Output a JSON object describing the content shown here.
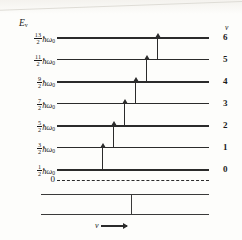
{
  "figure": {
    "type": "energy-level-diagram"
  },
  "axes": {
    "energy_axis_title": "E",
    "energy_axis_subscript": "v",
    "quantum_number_heading": "v",
    "bottom_axis_label": "v",
    "bottom_axis_arrow": "⟶"
  },
  "zero": {
    "label": "0"
  },
  "levels": [
    {
      "v": "6",
      "numerator": "13",
      "denominator": "2",
      "hbar": "ħ",
      "omega": "ω",
      "omega_sub": "0",
      "y": 37
    },
    {
      "v": "5",
      "numerator": "11",
      "denominator": "2",
      "hbar": "ħ",
      "omega": "ω",
      "omega_sub": "0",
      "y": 59
    },
    {
      "v": "4",
      "numerator": "9",
      "denominator": "2",
      "hbar": "ħ",
      "omega": "ω",
      "omega_sub": "0",
      "y": 81
    },
    {
      "v": "3",
      "numerator": "7",
      "denominator": "2",
      "hbar": "ħ",
      "omega": "ω",
      "omega_sub": "0",
      "y": 103
    },
    {
      "v": "2",
      "numerator": "5",
      "denominator": "2",
      "hbar": "ħ",
      "omega": "ω",
      "omega_sub": "0",
      "y": 125
    },
    {
      "v": "1",
      "numerator": "3",
      "denominator": "2",
      "hbar": "ħ",
      "omega": "ω",
      "omega_sub": "0",
      "y": 147
    },
    {
      "v": "0",
      "numerator": "1",
      "denominator": "2",
      "hbar": "ħ",
      "omega": "ω",
      "omega_sub": "0",
      "y": 169
    }
  ],
  "zero_line_y": 180,
  "transitions": [
    {
      "from_v": "0",
      "to_v": "1",
      "x": 102,
      "y_top": 147,
      "y_bottom": 169
    },
    {
      "from_v": "1",
      "to_v": "2",
      "x": 113,
      "y_top": 125,
      "y_bottom": 147
    },
    {
      "from_v": "2",
      "to_v": "3",
      "x": 124,
      "y_top": 103,
      "y_bottom": 125
    },
    {
      "from_v": "3",
      "to_v": "4",
      "x": 135,
      "y_top": 81,
      "y_bottom": 103
    },
    {
      "from_v": "4",
      "to_v": "5",
      "x": 146,
      "y_top": 59,
      "y_bottom": 81
    },
    {
      "from_v": "5",
      "to_v": "6",
      "x": 157,
      "y_top": 37,
      "y_bottom": 59
    }
  ],
  "spectrum": {
    "top_rule_y": 194,
    "bottom_rule_y": 214,
    "tick_x": 131,
    "tick_y": 194,
    "tick_height": 20
  },
  "colors": {
    "ink": "#2b2b2b",
    "paper": "#fdfdfb"
  }
}
